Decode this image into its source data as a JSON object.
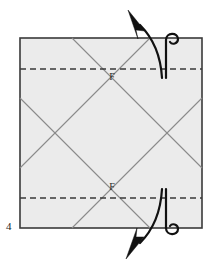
{
  "figure": {
    "kind": "origami-folding-diagram",
    "step_number": "4",
    "background_color": "#ffffff",
    "paper": {
      "fill_color": "#ebebeb",
      "edge_color": "#3a3a3a",
      "edge_width": 1.6,
      "left": 20,
      "top": 38,
      "right": 202,
      "bottom": 228
    },
    "fold_lines": {
      "valley_dashed_color": "#3a3a3a",
      "valley_dash_pattern": "6 4",
      "valley_dash_width": 1.5,
      "crease_color": "#8a8a8a",
      "crease_width": 1.1,
      "horizontal_valley_folds": [
        {
          "name": "upper-valley-fold",
          "y": 69
        },
        {
          "name": "lower-valley-fold",
          "y": 198
        }
      ],
      "diagonal_creases": [
        {
          "name": "crease-a",
          "x1": 20,
          "y1": 98,
          "x2": 150,
          "y2": 228
        },
        {
          "name": "crease-b",
          "x1": 20,
          "y1": 168,
          "x2": 150,
          "y2": 38
        },
        {
          "name": "crease-c",
          "x1": 72,
          "y1": 38,
          "x2": 202,
          "y2": 168
        },
        {
          "name": "crease-d",
          "x1": 72,
          "y1": 228,
          "x2": 202,
          "y2": 98
        }
      ]
    },
    "point_labels": [
      {
        "name": "point-label-upper-f",
        "text": "F",
        "x": 112,
        "y": 80
      },
      {
        "name": "point-label-lower-f",
        "text": "F",
        "x": 112,
        "y": 190
      }
    ],
    "arrows": {
      "color": "#111111",
      "stroke_width": 2.2,
      "top": {
        "name": "fold-up-arrow",
        "direction": "up-left",
        "description": "curved arrow from upper valley fold sweeping up and to the left"
      },
      "bottom": {
        "name": "fold-down-arrow",
        "direction": "down-left",
        "description": "curved arrow from lower valley fold sweeping down and to the left"
      },
      "hooks": [
        {
          "name": "top-fold-hook-icon",
          "edge": "top"
        },
        {
          "name": "bottom-fold-hook-icon",
          "edge": "bottom"
        }
      ]
    }
  }
}
